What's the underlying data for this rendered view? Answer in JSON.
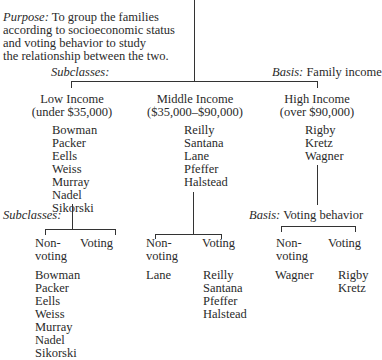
{
  "purpose": {
    "label": "Purpose:",
    "text_line1": " To group the families",
    "text_line2": "according to socioeconomic status",
    "text_line3": "and voting behavior to study",
    "text_line4": "the relationship between the two."
  },
  "level1": {
    "subclasses_label": "Subclasses:",
    "basis_label": "Basis:",
    "basis_value": " Family income",
    "groups": [
      {
        "title": "Low Income",
        "range": "(under $35,000)",
        "members": [
          "Bowman",
          "Packer",
          "Eells",
          "Weiss",
          "Murray",
          "Nadel",
          "Sikorski"
        ]
      },
      {
        "title": "Middle Income",
        "range": "($35,000–$90,000)",
        "members": [
          "Reilly",
          "Santana",
          "Lane",
          "Pfeffer",
          "Halstead"
        ]
      },
      {
        "title": "High Income",
        "range": "(over $90,000)",
        "members": [
          "Rigby",
          "Kretz",
          "Wagner"
        ]
      }
    ]
  },
  "level2": {
    "subclasses_label": "Subclasses:",
    "basis_label": "Basis:",
    "basis_value": " Voting behavior",
    "nonvoting_line1": "Non-",
    "nonvoting_line2": "voting",
    "voting_label": "Voting",
    "low": {
      "nonvoting": [
        "Bowman",
        "Packer",
        "Eells",
        "Weiss",
        "Murray",
        "Nadel",
        "Sikorski"
      ],
      "voting": []
    },
    "middle": {
      "nonvoting": [
        "Lane"
      ],
      "voting": [
        "Reilly",
        "Santana",
        "Pfeffer",
        "Halstead"
      ]
    },
    "high": {
      "nonvoting": [
        "Wagner"
      ],
      "voting": [
        "Rigby",
        "Kretz"
      ]
    }
  }
}
